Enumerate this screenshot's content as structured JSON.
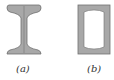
{
  "figure": {
    "panels": [
      {
        "id": "a",
        "label": "(a)",
        "shape": "I-beam cross-section"
      },
      {
        "id": "b",
        "label": "(b)",
        "shape": "box-section cross-section"
      }
    ],
    "colors": {
      "fill": "#a8a8a8",
      "outline": "#707070",
      "inner": "#ffffff"
    }
  }
}
